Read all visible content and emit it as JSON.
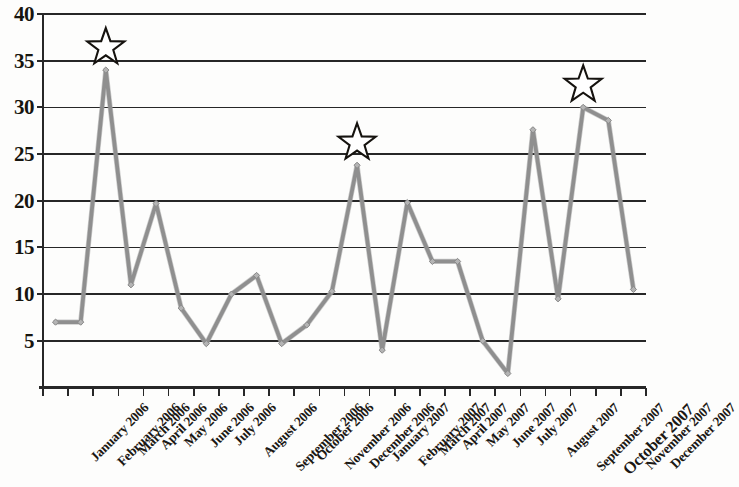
{
  "chart_data": {
    "type": "line",
    "title": "",
    "subtitle": "",
    "xlabel": "",
    "ylabel": "",
    "ylim": [
      0,
      40
    ],
    "yticks": [
      5,
      10,
      15,
      20,
      25,
      30,
      35,
      40
    ],
    "ytick_labels": [
      "5",
      "10",
      "15",
      "20",
      "25",
      "30",
      "35",
      "40"
    ],
    "grid": true,
    "grid_axis": "y",
    "legend": false,
    "legend_position": "none",
    "line_color": "#9a9a9a",
    "marker": "diamond",
    "categories": [
      "January 2006",
      "February 2006",
      "March 2006",
      "April 2006",
      "May 2006",
      "June 2006",
      "July 2006",
      "August 2006",
      "September 2006",
      "October 2006",
      "November 2006",
      "December 2006",
      "January 2007",
      "February 2007",
      "March 2007",
      "April 2007",
      "May 2007",
      "June 2007",
      "July 2007",
      "August 2007",
      "September 2007",
      "October 2007",
      "November 2007",
      "December 2007"
    ],
    "values": [
      7,
      7,
      34,
      11,
      19.7,
      8.5,
      4.7,
      10,
      12,
      4.7,
      6.7,
      10.3,
      23.8,
      4,
      19.8,
      13.5,
      13.5,
      5,
      1.5,
      27.6,
      9.5,
      30,
      28.6,
      10.5
    ],
    "emphasis_label_indices": [
      21
    ],
    "annotations": [
      {
        "type": "star",
        "category": "March 2006",
        "value": 34,
        "index": 2
      },
      {
        "type": "star",
        "category": "January 2007",
        "value": 23.8,
        "index": 12
      },
      {
        "type": "star",
        "category": "October 2007",
        "value": 30,
        "index": 21
      }
    ]
  }
}
